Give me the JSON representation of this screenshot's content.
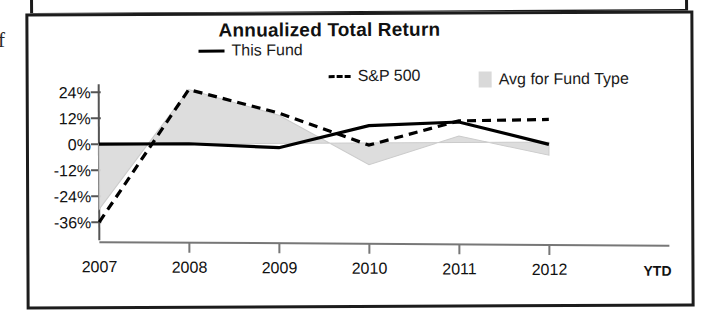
{
  "panel": {
    "stray_glyph": "f"
  },
  "chart_data": {
    "type": "line",
    "title": "Annualized Total Return",
    "xlabel": "",
    "ylabel": "",
    "categories": [
      "2007",
      "2008",
      "2009",
      "2010",
      "2011",
      "2012"
    ],
    "x_axis_suffix": "YTD",
    "ytick_labels": [
      "24%",
      "12%",
      "0%",
      "-12%",
      "-24%",
      "-36%"
    ],
    "ytick_values": [
      24,
      12,
      0,
      -12,
      -24,
      -36
    ],
    "ylim": [
      -40,
      28
    ],
    "grid": false,
    "legend_position": "top",
    "series": [
      {
        "name": "This Fund",
        "style": "solid",
        "color": "#000000",
        "values": [
          0,
          0,
          -2,
          8,
          9.5,
          -1
        ]
      },
      {
        "name": "S&P 500",
        "style": "dashed",
        "color": "#000000",
        "values": [
          -36,
          25,
          14,
          -1,
          10,
          10.5
        ]
      },
      {
        "name": "Avg for Fund Type",
        "style": "area",
        "color": "#d9d9d9",
        "values": [
          -30,
          25,
          13,
          -10,
          3,
          -6
        ]
      }
    ]
  }
}
